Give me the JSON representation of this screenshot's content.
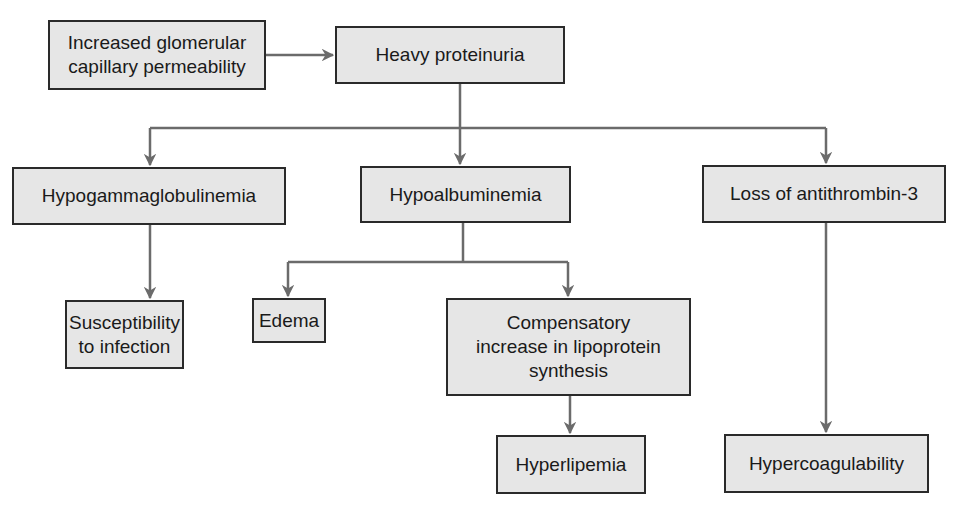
{
  "diagram": {
    "type": "flowchart",
    "colors": {
      "box_fill": "#e6e6e6",
      "box_border": "#2a2a2a",
      "arrow": "#6b6b6b",
      "text": "#1a1a1a"
    },
    "nodes": {
      "increased_permeability": "Increased glomerular\ncapillary permeability",
      "heavy_proteinuria": "Heavy proteinuria",
      "hypogammaglobulinemia": "Hypogammaglobulinemia",
      "hypoalbuminemia": "Hypoalbuminemia",
      "loss_antithrombin": "Loss of antithrombin-3",
      "susceptibility_infection": "Susceptibility\nto infection",
      "edema": "Edema",
      "compensatory_lipoprotein": "Compensatory\nincrease in lipoprotein\nsynthesis",
      "hyperlipemia": "Hyperlipemia",
      "hypercoagulability": "Hypercoagulability"
    },
    "edges": [
      [
        "Increased glomerular capillary permeability",
        "Heavy proteinuria"
      ],
      [
        "Heavy proteinuria",
        "Hypogammaglobulinemia"
      ],
      [
        "Heavy proteinuria",
        "Hypoalbuminemia"
      ],
      [
        "Heavy proteinuria",
        "Loss of antithrombin-3"
      ],
      [
        "Hypogammaglobulinemia",
        "Susceptibility to infection"
      ],
      [
        "Hypoalbuminemia",
        "Edema"
      ],
      [
        "Hypoalbuminemia",
        "Compensatory increase in lipoprotein synthesis"
      ],
      [
        "Compensatory increase in lipoprotein synthesis",
        "Hyperlipemia"
      ],
      [
        "Loss of antithrombin-3",
        "Hypercoagulability"
      ]
    ]
  }
}
